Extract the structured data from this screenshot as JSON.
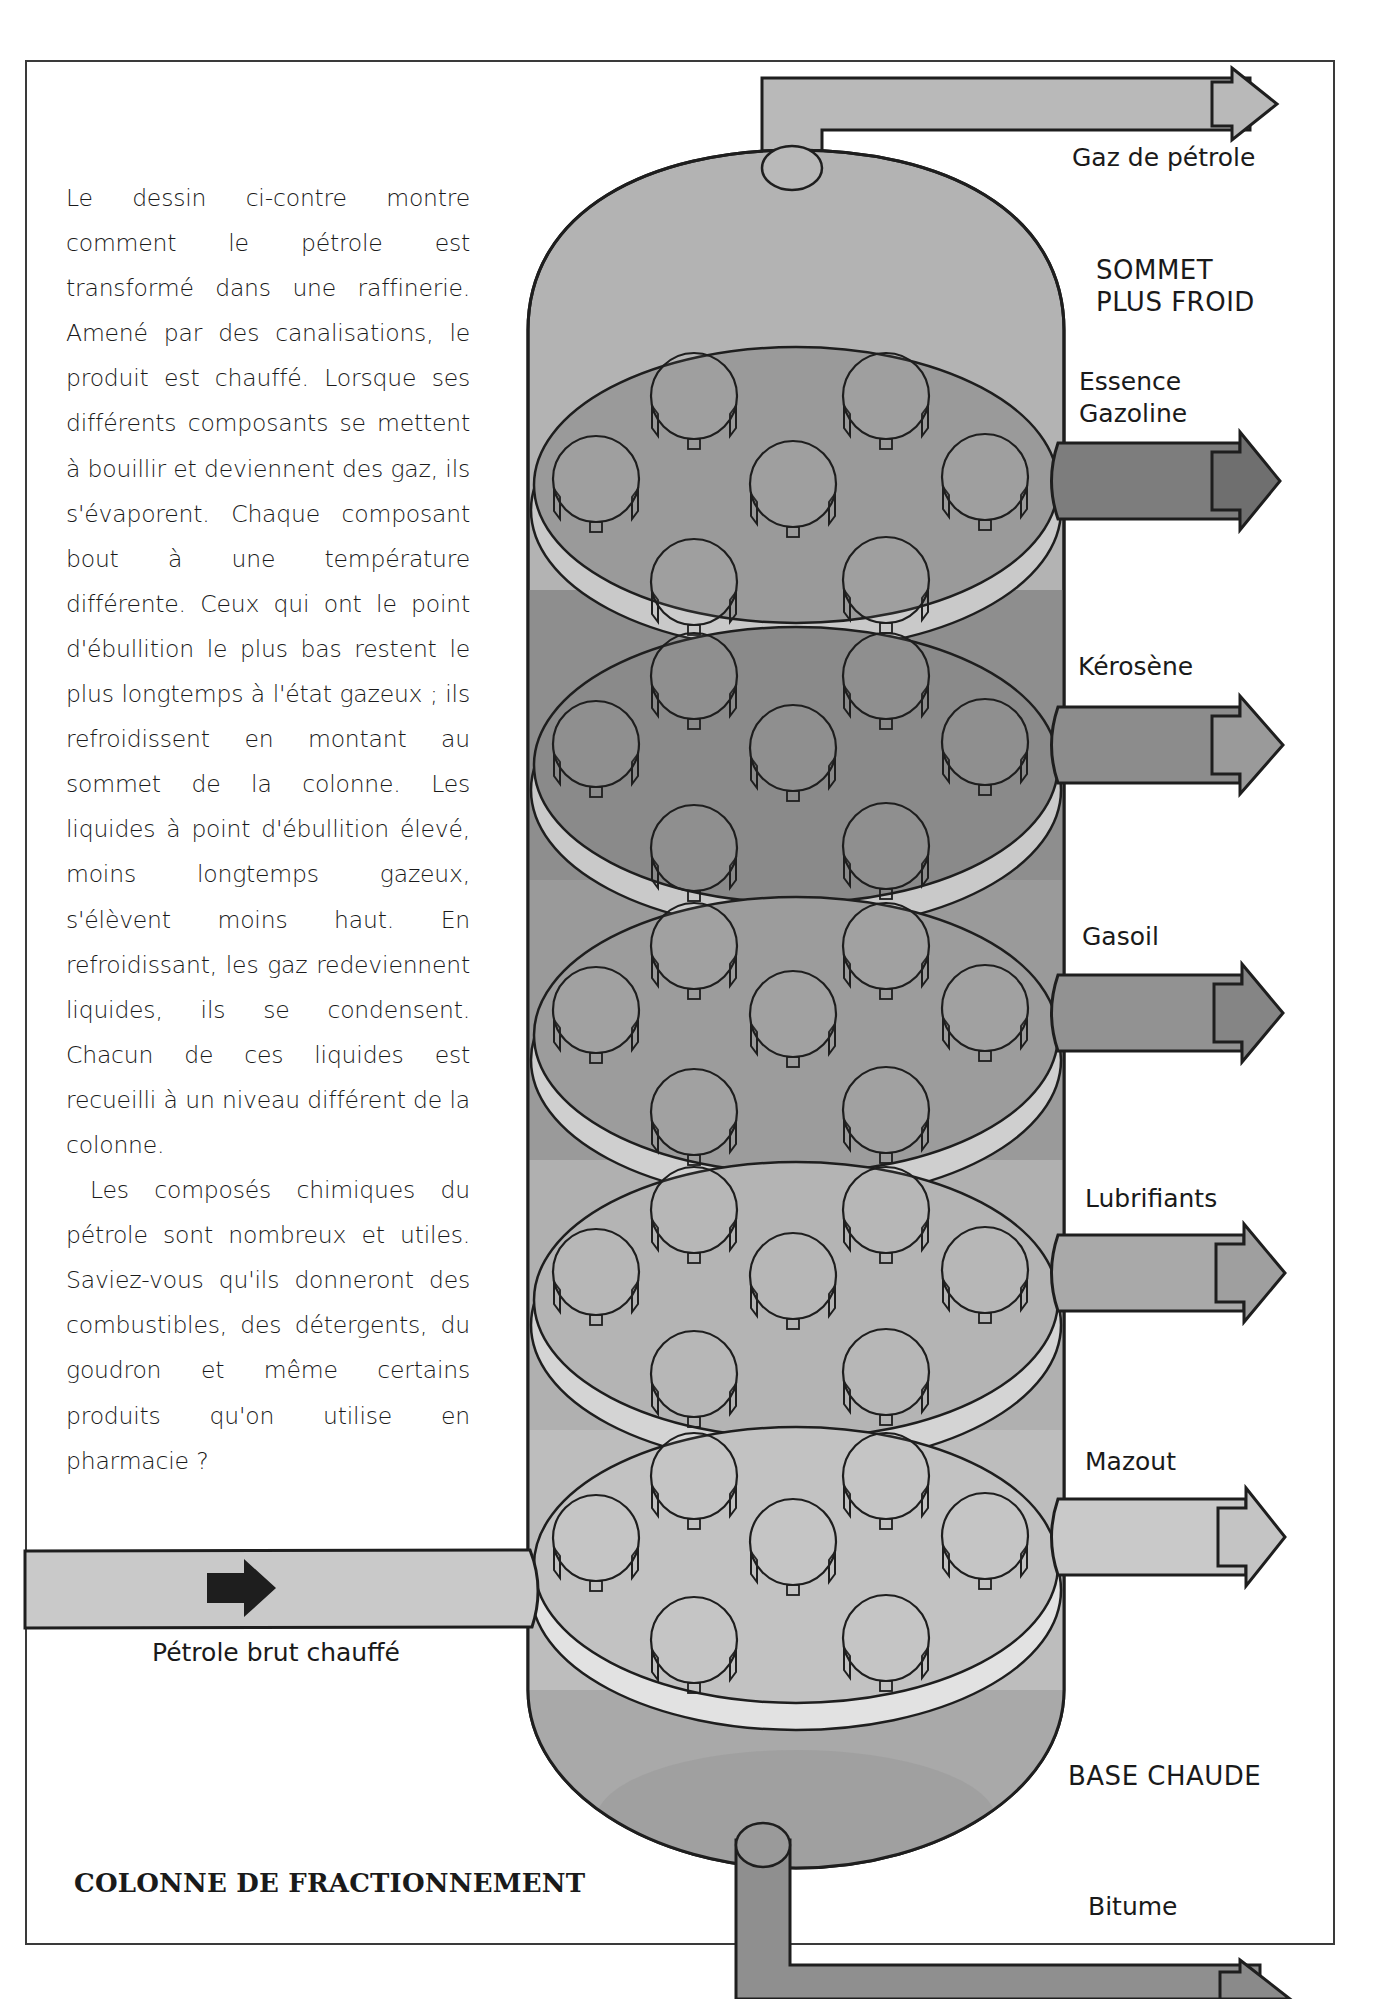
{
  "title": "COLONNE DE FRACTIONNEMENT",
  "body_text": {
    "paragraphs": [
      "Le dessin ci-contre montre comment le pétrole est transformé dans une raffinerie. Amené par des canalisations, le produit est chauffé. Lorsque ses différents composants se mettent à bouillir et deviennent des gaz, ils s'évaporent. Chaque composant bout à une température différente. Ceux qui ont le point d'ébullition le plus bas restent le plus longtemps à l'état gazeux ; ils refroidissent en montant au sommet de la colonne. Les liquides à point d'ébullition élevé, moins longtemps gazeux, s'élèvent moins haut. En refroidissant, les gaz redeviennent liquides, ils se condensent. Chacun de ces liquides est recueilli à un niveau différent de la colonne.",
      "Les composés chimiques du pétrole sont nombreux et utiles. Saviez-vous qu'ils donneront des combustibles, des détergents, du goudron et même certains produits qu'on utilise en pharmacie ?"
    ]
  },
  "zones": {
    "top": [
      "SOMMET",
      "PLUS FROID"
    ],
    "bottom": "BASE CHAUDE"
  },
  "inlet": {
    "label": "Pétrole brut chauffé",
    "arrow_icon": "right-arrow-icon"
  },
  "outputs": [
    {
      "id": "gaz",
      "label": "Gaz de pétrole",
      "color": "#b9b9b9"
    },
    {
      "id": "essence",
      "label_lines": [
        "Essence",
        "Gazoline"
      ],
      "color": "#7d7d7d"
    },
    {
      "id": "kerosene",
      "label": "Kérosène",
      "color": "#8c8c8c"
    },
    {
      "id": "gasoil",
      "label": "Gasoil",
      "color": "#929292"
    },
    {
      "id": "lubrifiants",
      "label": "Lubrifiants",
      "color": "#a9a9a9"
    },
    {
      "id": "mazout",
      "label": "Mazout",
      "color": "#c9c9c9"
    },
    {
      "id": "bitume",
      "label": "Bitume",
      "color": "#8f8f8f"
    }
  ],
  "column": {
    "tray_count": 5,
    "caps_per_tray": 7,
    "tray_colors": [
      "#9a9a9a",
      "#8a8a8a",
      "#9c9c9c",
      "#b4b4b4",
      "#c2c2c2"
    ],
    "dome_top_color": "#b3b3b3",
    "dome_bottom_color": "#a5a5a5",
    "outline_color": "#1e1e1e"
  }
}
